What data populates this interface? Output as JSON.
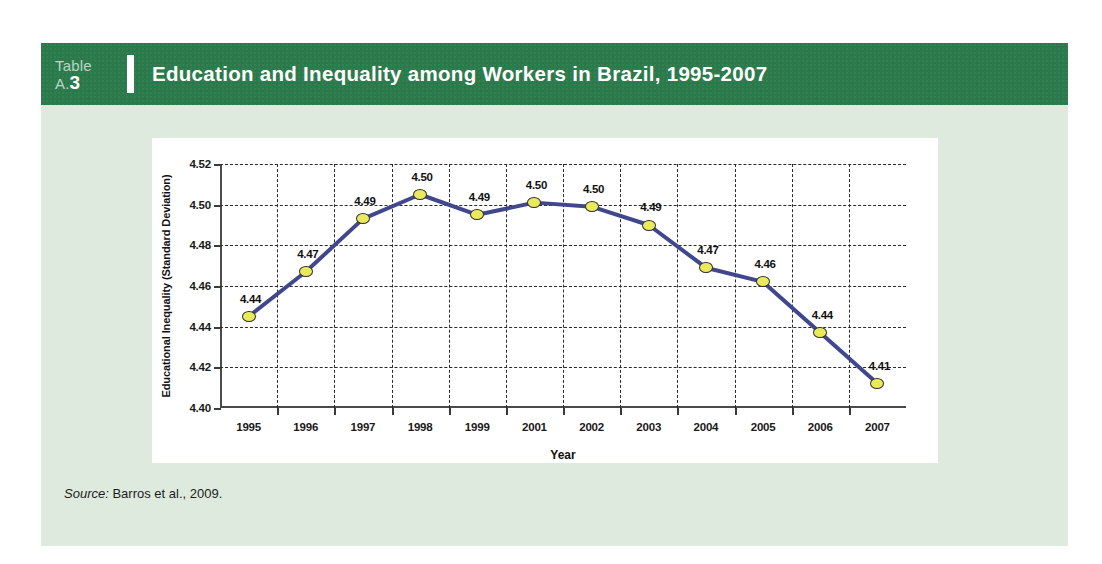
{
  "header": {
    "table_word": "Table",
    "table_prefix": "A.",
    "table_number": "3",
    "title": "Education and Inequality among Workers in Brazil, 1995-2007",
    "bar_color": "#2b7a4b",
    "text_color": "#ffffff",
    "label_color": "#b9d6c4"
  },
  "panel": {
    "background": "#dfeade",
    "card_background": "#ffffff"
  },
  "source": {
    "label": "Source:",
    "text": " Barros et al., 2009."
  },
  "chart_data": {
    "type": "line",
    "title": "",
    "xlabel": "Year",
    "ylabel": "Educational Inequality (Standard Deviation)",
    "categories": [
      "1995",
      "1996",
      "1997",
      "1998",
      "1999",
      "2001",
      "2002",
      "2003",
      "2004",
      "2005",
      "2006",
      "2007"
    ],
    "values": [
      4.445,
      4.467,
      4.493,
      4.505,
      4.495,
      4.501,
      4.499,
      4.49,
      4.469,
      4.462,
      4.437,
      4.412
    ],
    "point_labels": [
      "4.44",
      "4.47",
      "4.49",
      "4.50",
      "4.49",
      "4.50",
      "4.50",
      "4.49",
      "4.47",
      "4.46",
      "4.44",
      "4.41"
    ],
    "ylim": [
      4.4,
      4.52
    ],
    "yticks": [
      4.4,
      4.42,
      4.44,
      4.46,
      4.48,
      4.5,
      4.52
    ],
    "ytick_labels": [
      "4.40",
      "4.42",
      "4.44",
      "4.46",
      "4.48",
      "4.50",
      "4.52"
    ],
    "grid": true,
    "legend": "none",
    "line_color": "#41478c",
    "marker_color": "#e9e95c",
    "marker_edge_color": "#2f2f2f",
    "grid_color": "#2a2a2a",
    "axis_color": "#4a4a4a"
  }
}
